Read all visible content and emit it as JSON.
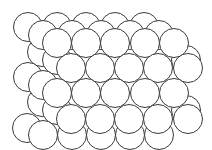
{
  "diagram": {
    "title": "",
    "colors": {
      "background": "#ffffff",
      "stroke": "#3a3a3a",
      "fill": "#ffffff"
    },
    "radius": 14.5,
    "layers": [
      {
        "name": "layer-3-back",
        "circles": [
          [
            28,
            27
          ],
          [
            57,
            27
          ],
          [
            86,
            27
          ],
          [
            115,
            27
          ],
          [
            144,
            27
          ],
          [
            42,
            52
          ],
          [
            28,
            77
          ],
          [
            42,
            102
          ],
          [
            27,
            128
          ]
        ]
      },
      {
        "name": "layer-2-middle",
        "circles": [
          [
            43,
            35
          ],
          [
            72,
            35
          ],
          [
            101,
            35
          ],
          [
            130,
            35
          ],
          [
            159,
            35
          ],
          [
            57,
            60
          ],
          [
            186,
            60
          ],
          [
            43,
            85
          ],
          [
            57,
            110
          ],
          [
            186,
            110
          ],
          [
            43,
            135
          ],
          [
            72,
            135
          ],
          [
            101,
            135
          ],
          [
            130,
            135
          ],
          [
            159,
            135
          ]
        ]
      },
      {
        "name": "layer-1-front",
        "circles": [
          [
            57,
            43
          ],
          [
            86,
            43
          ],
          [
            115,
            43
          ],
          [
            145,
            43
          ],
          [
            174,
            43
          ],
          [
            71,
            68
          ],
          [
            100,
            68
          ],
          [
            129,
            68
          ],
          [
            158,
            68
          ],
          [
            188,
            68
          ],
          [
            57,
            93
          ],
          [
            86,
            93
          ],
          [
            115,
            93
          ],
          [
            145,
            93
          ],
          [
            174,
            93
          ],
          [
            71,
            119
          ],
          [
            100,
            119
          ],
          [
            129,
            119
          ],
          [
            158,
            119
          ],
          [
            188,
            119
          ]
        ]
      }
    ]
  }
}
